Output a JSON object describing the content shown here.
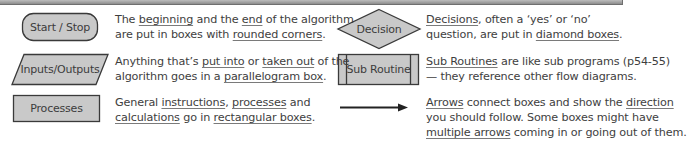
{
  "colors": {
    "shape_fill": "#c9c9c9",
    "shape_stroke": "#3a3a3a",
    "text": "#3e3e3e",
    "top_bar": "#a0a0a0"
  },
  "symbols": [
    {
      "id": "start-stop",
      "shape": "rounded-rectangle",
      "label": "Start / Stop",
      "description": [
        {
          "t": "The "
        },
        {
          "t": "beginning",
          "u": true
        },
        {
          "t": " and the "
        },
        {
          "t": "end",
          "u": true
        },
        {
          "t": " of the algorithm"
        },
        {
          "br": true
        },
        {
          "t": "are put in boxes with "
        },
        {
          "t": "rounded corners",
          "u": true
        },
        {
          "t": "."
        }
      ]
    },
    {
      "id": "inputs-outputs",
      "shape": "parallelogram",
      "label": "Inputs/Outputs",
      "description": [
        {
          "t": "Anything that’s "
        },
        {
          "t": "put into",
          "u": true
        },
        {
          "t": " or "
        },
        {
          "t": "taken out",
          "u": true
        },
        {
          "t": " of the"
        },
        {
          "br": true
        },
        {
          "t": "algorithm goes in a "
        },
        {
          "t": "parallelogram box",
          "u": true
        },
        {
          "t": "."
        }
      ]
    },
    {
      "id": "processes",
      "shape": "rectangle",
      "label": "Processes",
      "description": [
        {
          "t": "General "
        },
        {
          "t": "instructions",
          "u": true
        },
        {
          "t": ", "
        },
        {
          "t": "processes",
          "u": true
        },
        {
          "t": " and"
        },
        {
          "br": true
        },
        {
          "t": "calculations",
          "u": true
        },
        {
          "t": " go in "
        },
        {
          "t": "rectangular boxes",
          "u": true
        },
        {
          "t": "."
        }
      ]
    },
    {
      "id": "decision",
      "shape": "diamond",
      "label": "Decision",
      "description": [
        {
          "t": "Decisions",
          "u": true
        },
        {
          "t": ", often a ‘yes’ or ‘no’"
        },
        {
          "br": true
        },
        {
          "t": "question, are put in "
        },
        {
          "t": "diamond boxes",
          "u": true
        },
        {
          "t": "."
        }
      ]
    },
    {
      "id": "sub-routine",
      "shape": "double-sided-rectangle",
      "label": "Sub Routine",
      "description": [
        {
          "t": "Sub Routines",
          "u": true
        },
        {
          "t": " are like sub programs (p54-55)"
        },
        {
          "br": true
        },
        {
          "t": "— they reference other flow diagrams."
        }
      ]
    },
    {
      "id": "arrow",
      "shape": "arrow",
      "label": "",
      "description": [
        {
          "t": "Arrows",
          "u": true
        },
        {
          "t": " connect boxes and show the "
        },
        {
          "t": "direction",
          "u": true
        },
        {
          "br": true
        },
        {
          "t": "you should follow.  Some boxes might have"
        },
        {
          "br": true
        },
        {
          "t": "multiple arrows",
          "u": true
        },
        {
          "t": " coming in or going out of them."
        }
      ]
    }
  ]
}
